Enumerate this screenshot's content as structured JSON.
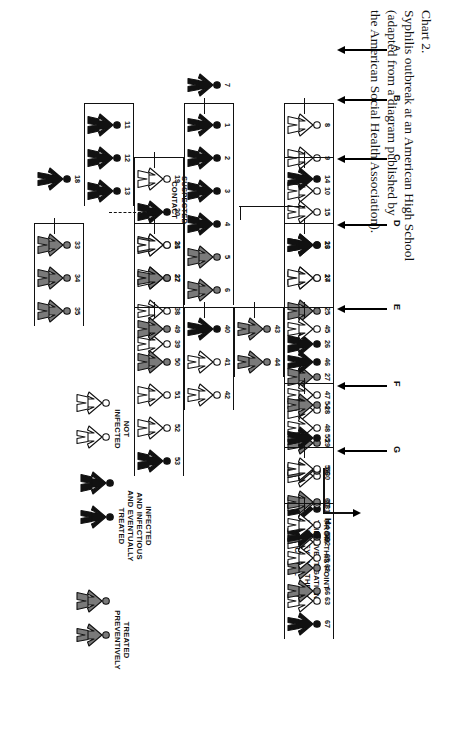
{
  "caption": {
    "label": "Chart 2.",
    "lines": [
      "Chart 2.",
      "Syphilis outbreak at an American High School",
      "(adapted from a diagram published by",
      "the American Social Health Association)."
    ]
  },
  "generations": {
    "label_a": "A",
    "label_b": "B",
    "label_c": "C",
    "label_d": "D",
    "label_e": "E",
    "label_f": "F",
    "label_g": "G",
    "label_h": "H"
  },
  "annotations": {
    "suspected_contact": "SUSPECTED\nCONTACT",
    "suspected_contact_l1": "SUSPECTED",
    "suspected_contact_l2": "CONTACT",
    "beyond_l1": "FROM THIS POINT",
    "beyond_l2": "THE INVESTIGATION",
    "beyond_l3": "LED BEYOND THE",
    "beyond_l4": "HIGH SCHOOL"
  },
  "legend": {
    "infected": {
      "l1": "INFECTED",
      "l2": "AND INFECTIOUS",
      "l3": "AND EVENTUALLY",
      "l4": "TREATED",
      "state": "infected"
    },
    "preventive": {
      "l1": "TREATED",
      "l2": "PREVENTIVELY",
      "state": "preventive"
    },
    "notinfected": {
      "l1": "NOT",
      "l2": "INFECTED",
      "state": "notinfected"
    }
  },
  "colors": {
    "infected": "#111111",
    "preventive": "#7a7a7a",
    "notinfected": "#ffffff",
    "outline": "#111111",
    "background": "#ffffff"
  },
  "chart_data": {
    "type": "diagram",
    "title": "Syphilis outbreak at an American High School",
    "subtitle": "(adapted from a diagram published by the American Social Health Association).",
    "states": [
      "infected",
      "preventive",
      "notinfected"
    ],
    "generations": [
      "A",
      "B",
      "C",
      "D",
      "E",
      "F",
      "G",
      "H"
    ],
    "cases": [
      {
        "id": "7",
        "state": "infected",
        "sex": "m",
        "gen": "A"
      },
      {
        "id": "1",
        "state": "infected",
        "sex": "m",
        "gen": "B"
      },
      {
        "id": "2",
        "state": "infected",
        "sex": "f",
        "gen": "B"
      },
      {
        "id": "3",
        "state": "infected",
        "sex": "f",
        "gen": "B"
      },
      {
        "id": "4",
        "state": "infected",
        "sex": "f",
        "gen": "B"
      },
      {
        "id": "5",
        "state": "preventive",
        "sex": "f",
        "gen": "B"
      },
      {
        "id": "6",
        "state": "preventive",
        "sex": "f",
        "gen": "B"
      },
      {
        "id": "8",
        "state": "notinfected",
        "sex": "f",
        "gen": "B"
      },
      {
        "id": "9",
        "state": "notinfected",
        "sex": "f",
        "gen": "B"
      },
      {
        "id": "10",
        "state": "notinfected",
        "sex": "f",
        "gen": "B"
      },
      {
        "id": "11",
        "state": "infected",
        "sex": "f",
        "gen": "B"
      },
      {
        "id": "12",
        "state": "infected",
        "sex": "f",
        "gen": "B"
      },
      {
        "id": "13",
        "state": "infected",
        "sex": "f",
        "gen": "B"
      },
      {
        "id": "14",
        "state": "infected",
        "sex": "m",
        "gen": "C"
      },
      {
        "id": "15",
        "state": "notinfected",
        "sex": "m",
        "gen": "C"
      },
      {
        "id": "16",
        "state": "notinfected",
        "sex": "m",
        "gen": "C"
      },
      {
        "id": "17",
        "state": "infected",
        "sex": "m",
        "gen": "C"
      },
      {
        "id": "18",
        "state": "infected",
        "sex": "m",
        "gen": "C"
      },
      {
        "id": "19",
        "state": "notinfected",
        "sex": "f",
        "gen": "C"
      },
      {
        "id": "20",
        "state": "infected",
        "sex": "f",
        "gen": "C"
      },
      {
        "id": "21",
        "state": "preventive",
        "sex": "f",
        "gen": "C"
      },
      {
        "id": "22",
        "state": "notinfected",
        "sex": "f",
        "gen": "C"
      },
      {
        "id": "23",
        "state": "infected",
        "sex": "m",
        "gen": "D"
      },
      {
        "id": "24",
        "state": "notinfected",
        "sex": "f",
        "gen": "D"
      },
      {
        "id": "25",
        "state": "preventive",
        "sex": "f",
        "gen": "D"
      },
      {
        "id": "26",
        "state": "infected",
        "sex": "f",
        "gen": "D"
      },
      {
        "id": "27",
        "state": "preventive",
        "sex": "f",
        "gen": "D"
      },
      {
        "id": "28",
        "state": "notinfected",
        "sex": "f",
        "gen": "D"
      },
      {
        "id": "29",
        "state": "preventive",
        "sex": "m",
        "gen": "D"
      },
      {
        "id": "30",
        "state": "notinfected",
        "sex": "m",
        "gen": "D"
      },
      {
        "id": "31",
        "state": "infected",
        "sex": "m",
        "gen": "D"
      },
      {
        "id": "32",
        "state": "notinfected",
        "sex": "m",
        "gen": "D"
      },
      {
        "id": "33",
        "state": "preventive",
        "sex": "f",
        "gen": "D"
      },
      {
        "id": "34",
        "state": "preventive",
        "sex": "f",
        "gen": "D"
      },
      {
        "id": "35",
        "state": "preventive",
        "sex": "f",
        "gen": "D"
      },
      {
        "id": "36",
        "state": "notinfected",
        "sex": "m",
        "gen": "D"
      },
      {
        "id": "37",
        "state": "preventive",
        "sex": "m",
        "gen": "D"
      },
      {
        "id": "38",
        "state": "notinfected",
        "sex": "m",
        "gen": "D"
      },
      {
        "id": "39",
        "state": "notinfected",
        "sex": "m",
        "gen": "D"
      },
      {
        "id": "40",
        "state": "infected",
        "sex": "m",
        "gen": "E"
      },
      {
        "id": "41",
        "state": "notinfected",
        "sex": "m",
        "gen": "E"
      },
      {
        "id": "42",
        "state": "notinfected",
        "sex": "m",
        "gen": "E"
      },
      {
        "id": "43",
        "state": "preventive",
        "sex": "m",
        "gen": "E"
      },
      {
        "id": "44",
        "state": "preventive",
        "sex": "m",
        "gen": "E"
      },
      {
        "id": "45",
        "state": "notinfected",
        "sex": "m",
        "gen": "E"
      },
      {
        "id": "46",
        "state": "infected",
        "sex": "m",
        "gen": "E"
      },
      {
        "id": "47",
        "state": "notinfected",
        "sex": "m",
        "gen": "E"
      },
      {
        "id": "48",
        "state": "notinfected",
        "sex": "m",
        "gen": "E"
      },
      {
        "id": "49",
        "state": "preventive",
        "sex": "f",
        "gen": "E"
      },
      {
        "id": "50",
        "state": "preventive",
        "sex": "f",
        "gen": "E"
      },
      {
        "id": "51",
        "state": "notinfected",
        "sex": "f",
        "gen": "E"
      },
      {
        "id": "52",
        "state": "notinfected",
        "sex": "f",
        "gen": "E"
      },
      {
        "id": "53",
        "state": "infected",
        "sex": "f",
        "gen": "E"
      },
      {
        "id": "54",
        "state": "preventive",
        "sex": "m",
        "gen": "F"
      },
      {
        "id": "55",
        "state": "infected",
        "sex": "m",
        "gen": "F"
      },
      {
        "id": "56",
        "state": "preventive",
        "sex": "m",
        "gen": "F"
      },
      {
        "id": "57",
        "state": "notinfected",
        "sex": "m",
        "gen": "F"
      },
      {
        "id": "58",
        "state": "preventive",
        "sex": "m",
        "gen": "F"
      },
      {
        "id": "59",
        "state": "notinfected",
        "sex": "m",
        "gen": "G"
      },
      {
        "id": "60",
        "state": "preventive",
        "sex": "m",
        "gen": "G"
      },
      {
        "id": "61",
        "state": "infected",
        "sex": "m",
        "gen": "G"
      },
      {
        "id": "62",
        "state": "preventive",
        "sex": "m",
        "gen": "G"
      },
      {
        "id": "63",
        "state": "notinfected",
        "sex": "m",
        "gen": "G"
      },
      {
        "id": "64",
        "state": "notinfected",
        "sex": "m",
        "gen": "H"
      },
      {
        "id": "65",
        "state": "notinfected",
        "sex": "m",
        "gen": "H"
      },
      {
        "id": "66",
        "state": "preventive",
        "sex": "m",
        "gen": "H"
      },
      {
        "id": "67",
        "state": "infected",
        "sex": "m",
        "gen": "H"
      }
    ]
  }
}
